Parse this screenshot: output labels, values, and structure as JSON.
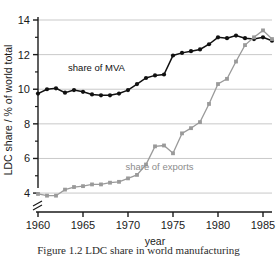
{
  "figure": {
    "caption": "Figure 1.2   LDC share in world manufacturing"
  },
  "axes": {
    "ylabel": "LDC share / % of world total",
    "xlabel": "year",
    "y_ticks": [
      "4",
      "6",
      "8",
      "10",
      "12",
      "14"
    ],
    "x_ticks": [
      "1960",
      "1965",
      "1970",
      "1975",
      "1980",
      "1985"
    ],
    "axis_break_symbol": "axis-break"
  },
  "legend": {
    "mva_label": "share of MVA",
    "exports_label": "share of exports"
  },
  "colors": {
    "mva": "#111111",
    "exports": "#9a9a9a",
    "gridline": "#c9c9c9",
    "axis": "#1a1a1a",
    "background": "#ffffff"
  },
  "chart_data": {
    "type": "line",
    "title": "",
    "xlabel": "year",
    "ylabel": "LDC share / % of world total",
    "xlim": [
      1960,
      1986
    ],
    "ylim": [
      3.6,
      14
    ],
    "grid": true,
    "y_ticks": [
      4,
      6,
      8,
      10,
      12,
      14
    ],
    "x_ticks": [
      1960,
      1965,
      1970,
      1975,
      1980,
      1985
    ],
    "y_axis_break_below": 4,
    "legend_position": "inline-annotations",
    "x": [
      1960,
      1961,
      1962,
      1963,
      1964,
      1965,
      1966,
      1967,
      1968,
      1969,
      1970,
      1971,
      1972,
      1973,
      1974,
      1975,
      1976,
      1977,
      1978,
      1979,
      1980,
      1981,
      1982,
      1983,
      1984,
      1985,
      1986
    ],
    "series": [
      {
        "name": "share of MVA",
        "color": "#111111",
        "marker": "filled-circle",
        "values": [
          9.75,
          10.0,
          10.05,
          9.8,
          9.95,
          9.85,
          9.7,
          9.65,
          9.65,
          9.75,
          9.95,
          10.3,
          10.65,
          10.8,
          10.85,
          11.95,
          12.1,
          12.2,
          12.3,
          12.6,
          13.0,
          12.95,
          13.1,
          12.95,
          12.9,
          13.0,
          12.8
        ]
      },
      {
        "name": "share of exports",
        "color": "#9a9a9a",
        "marker": "filled-square",
        "values": [
          3.95,
          3.85,
          3.85,
          4.2,
          4.35,
          4.4,
          4.5,
          4.5,
          4.6,
          4.65,
          4.85,
          5.05,
          5.65,
          6.7,
          6.75,
          6.3,
          7.45,
          7.75,
          8.1,
          9.15,
          10.3,
          10.6,
          11.6,
          12.55,
          13.0,
          13.4,
          12.9
        ]
      }
    ],
    "annotations": [
      {
        "text": "share of MVA",
        "x": 1966.5,
        "y": 11.05,
        "color": "#111111"
      },
      {
        "text": "share of exports",
        "x": 1973.5,
        "y": 5.35,
        "color": "#9a9a9a"
      }
    ]
  }
}
